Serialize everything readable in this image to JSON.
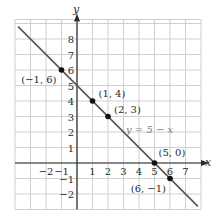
{
  "chart_data": {
    "type": "line",
    "title": "",
    "xlabel": "x",
    "ylabel": "y",
    "xlim": [
      -4,
      8
    ],
    "ylim": [
      -3,
      9
    ],
    "grid": true,
    "x_ticks": [
      "−2",
      "−1",
      "1",
      "2",
      "3",
      "4",
      "5",
      "6",
      "7"
    ],
    "x_tick_values": [
      -2,
      -1,
      1,
      2,
      3,
      4,
      5,
      6,
      7
    ],
    "y_ticks": [
      "8",
      "7",
      "6",
      "5",
      "4",
      "3",
      "2",
      "1",
      "−1",
      "−2"
    ],
    "y_tick_values": [
      8,
      7,
      6,
      5,
      4,
      3,
      2,
      1,
      -1,
      -2
    ],
    "series": [
      {
        "name": "y = 5 − x",
        "equation_label": "y = 5 − x",
        "line_from": [
          -3.8,
          8.8
        ],
        "line_to": [
          7.8,
          -2.8
        ],
        "color": "#555555"
      }
    ],
    "points": [
      {
        "x": -1,
        "y": 6,
        "label": "(−1, 6)"
      },
      {
        "x": 1,
        "y": 4,
        "label": "(1, 4)"
      },
      {
        "x": 2,
        "y": 3,
        "label": "(2, 3)"
      },
      {
        "x": 5,
        "y": 0,
        "label": "(5, 0)"
      },
      {
        "x": 6,
        "y": -1,
        "label": "(6, −1)"
      }
    ],
    "colors": {
      "grid": "#cfcfcf",
      "axis": "#2a2a2a",
      "line": "#555555",
      "point": "#111111"
    }
  }
}
